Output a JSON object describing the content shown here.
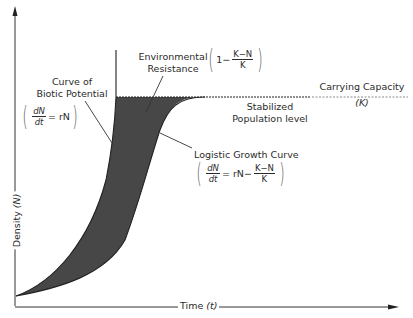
{
  "diagram": {
    "type": "logistic-vs-exponential-growth",
    "axes": {
      "y_label": "Density",
      "y_symbol": "(N)",
      "x_label": "Time",
      "x_symbol": "(t)"
    },
    "labels": {
      "biotic_title_line1": "Curve of",
      "biotic_title_line2": "Biotic Potential",
      "biotic_eq_num": "dN",
      "biotic_eq_den": "dt",
      "biotic_eq_rhs": "= rN",
      "env_title_line1": "Environmental",
      "env_title_line2": "Resistance",
      "env_eq_prefix": "1−",
      "env_eq_num": "K−N",
      "env_eq_den": "K",
      "carrying_line1": "Carrying  Capacity",
      "carrying_line2": "(K)",
      "stabilized_line1": "Stabilized",
      "stabilized_line2": "Population  level",
      "logistic_title": "Logistic Growth Curve",
      "logistic_eq_num": "dN",
      "logistic_eq_den": "dt",
      "logistic_eq_mid": "= rN−",
      "logistic_eq_frac_num": "K−N",
      "logistic_eq_frac_den": "K"
    },
    "colors": {
      "line": "#2a2a2a",
      "shaded_region": "#4a4a4a",
      "dashed_light": "#8a8a8a"
    }
  }
}
